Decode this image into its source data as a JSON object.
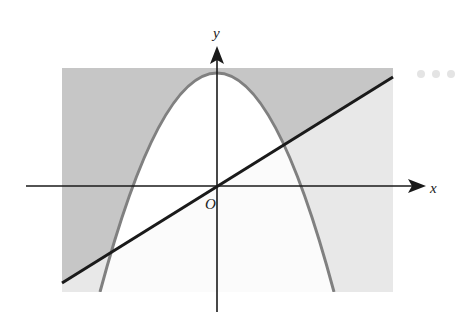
{
  "diagram": {
    "type": "inequality-region-graph",
    "axes": {
      "x_label": "x",
      "y_label": "y",
      "origin_label": "O"
    },
    "curves": [
      {
        "name": "parabola",
        "description": "downward-opening parabola, vertex on y-axis",
        "color": "#808080"
      },
      {
        "name": "line",
        "description": "straight line through origin with positive slope",
        "color": "#1a1a1a"
      }
    ],
    "regions": {
      "outside_parabola_above_line": "#c6c6c6",
      "outside_parabola_below_line": "#e8e8e8",
      "inside_parabola_above_line": "#ffffff",
      "inside_parabola_below_line": "#fbfbfb"
    }
  },
  "overflow_menu": {
    "icon": "more-horizontal-icon"
  }
}
